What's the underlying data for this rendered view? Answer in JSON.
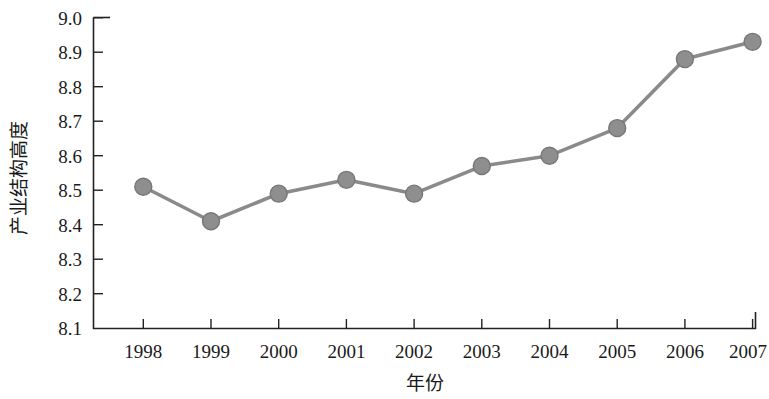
{
  "chart_data": {
    "type": "line",
    "title": "",
    "xlabel": "年份",
    "ylabel": "产业结构高度",
    "categories": [
      "1998",
      "1999",
      "2000",
      "2001",
      "2002",
      "2003",
      "2004",
      "2005",
      "2006",
      "2007"
    ],
    "values": [
      8.51,
      8.41,
      8.49,
      8.53,
      8.49,
      8.57,
      8.6,
      8.68,
      8.88,
      8.93
    ],
    "series": [
      {
        "name": "产业结构高度",
        "values": [
          8.51,
          8.41,
          8.49,
          8.53,
          8.49,
          8.57,
          8.6,
          8.68,
          8.88,
          8.93
        ]
      }
    ],
    "ylim": [
      8.1,
      9.0
    ],
    "ytick_labels": [
      "9.0",
      "8.9",
      "8.8",
      "8.7",
      "8.6",
      "8.5",
      "8.4",
      "8.3",
      "8.2",
      "8.1"
    ],
    "ytick_values": [
      9.0,
      8.9,
      8.8,
      8.7,
      8.6,
      8.5,
      8.4,
      8.3,
      8.2,
      8.1
    ],
    "grid": false,
    "legend": "none",
    "colors": {
      "line": "#8a8a8a",
      "marker": "#8e8e8e",
      "marker_edge": "#777777",
      "axis": "#222222",
      "text": "#1a1a1a",
      "background": "#ffffff"
    }
  }
}
